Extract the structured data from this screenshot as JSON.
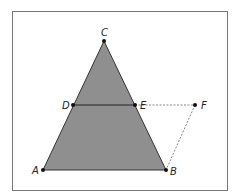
{
  "figure": {
    "fill_color": "#8f8f8f",
    "points": {
      "A": {
        "label": "A",
        "x": 43,
        "y": 170
      },
      "B": {
        "label": "B",
        "x": 166,
        "y": 170
      },
      "C": {
        "label": "C",
        "x": 104,
        "y": 41
      },
      "D": {
        "label": "D",
        "x": 73,
        "y": 105
      },
      "E": {
        "label": "E",
        "x": 135,
        "y": 105
      },
      "F": {
        "label": "F",
        "x": 195,
        "y": 105
      }
    },
    "solid_segments": [
      "AB",
      "BC",
      "CA",
      "DE"
    ],
    "dashed_segments": [
      "EF",
      "FB"
    ]
  }
}
